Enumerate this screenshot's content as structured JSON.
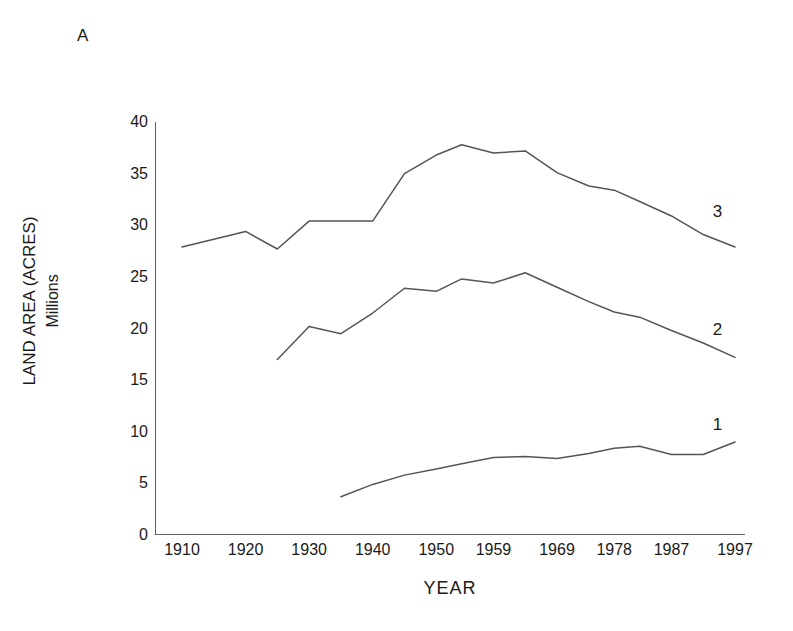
{
  "figure": {
    "panel_label": "A",
    "background": "#ffffff",
    "line_color": "#555555"
  },
  "chart_data": {
    "type": "line",
    "title": "",
    "subtitle": "",
    "panel": "A",
    "xlabel": "YEAR",
    "ylabel": "LAND AREA (ACRES)",
    "ylabel_line2": "Millions",
    "xlim": [
      1910,
      1997
    ],
    "ylim": [
      0,
      40
    ],
    "ytick_values": [
      0,
      5,
      10,
      15,
      20,
      25,
      30,
      35,
      40
    ],
    "ytick_labels": [
      "0",
      "5",
      "10",
      "15",
      "20",
      "25",
      "30",
      "35",
      "40"
    ],
    "yminor_step": 2.5,
    "xtick_labels": [
      "1910",
      "1920",
      "1930",
      "1940",
      "1950",
      "1959",
      "1969",
      "1978",
      "1987",
      "1997"
    ],
    "xtick_values": [
      1910,
      1920,
      1930,
      1940,
      1950,
      1959,
      1969,
      1978,
      1987,
      1997
    ],
    "xminor_ticks": true,
    "grid": false,
    "legend": "inline-right-end-labels",
    "units": "millions of acres",
    "series": [
      {
        "name": "1",
        "label": "1",
        "label_xy": [
          1993.5,
          10.6
        ],
        "x": [
          1935,
          1940,
          1945,
          1950,
          1954,
          1959,
          1964,
          1969,
          1974,
          1978,
          1982,
          1987,
          1992,
          1997
        ],
        "y": [
          3.7,
          4.9,
          5.8,
          6.4,
          6.9,
          7.5,
          7.6,
          7.4,
          7.9,
          8.4,
          8.6,
          7.8,
          7.8,
          9.0
        ]
      },
      {
        "name": "2",
        "label": "2",
        "label_xy": [
          1993.5,
          19.8
        ],
        "x": [
          1925,
          1930,
          1935,
          1940,
          1945,
          1950,
          1954,
          1959,
          1964,
          1969,
          1974,
          1978,
          1982,
          1987,
          1992,
          1997
        ],
        "y": [
          17.0,
          20.2,
          19.5,
          21.5,
          23.9,
          23.6,
          24.8,
          24.4,
          25.4,
          24.0,
          22.6,
          21.6,
          21.1,
          19.8,
          18.6,
          17.2
        ]
      },
      {
        "name": "3",
        "label": "3",
        "label_xy": [
          1993.5,
          31.2
        ],
        "x": [
          1910,
          1920,
          1925,
          1930,
          1935,
          1940,
          1945,
          1950,
          1954,
          1959,
          1964,
          1969,
          1974,
          1978,
          1982,
          1987,
          1992,
          1997
        ],
        "y": [
          27.9,
          29.4,
          27.7,
          30.4,
          30.4,
          30.4,
          35.0,
          36.8,
          37.8,
          37.0,
          37.2,
          35.1,
          33.8,
          33.4,
          32.3,
          30.9,
          29.1,
          27.9
        ]
      }
    ]
  }
}
